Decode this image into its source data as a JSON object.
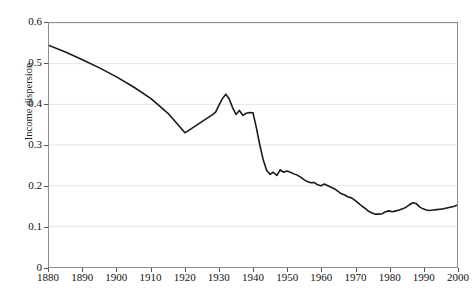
{
  "chart_data": {
    "type": "line",
    "title": "",
    "xlabel": "",
    "ylabel": "Income dispersion",
    "xlim": [
      1880,
      2000
    ],
    "ylim": [
      0,
      0.6
    ],
    "grid": true,
    "legend": null,
    "xticks": [
      1880,
      1890,
      1900,
      1910,
      1920,
      1930,
      1940,
      1950,
      1960,
      1970,
      1980,
      1990,
      2000
    ],
    "xtick_labels": [
      "1880",
      "1890",
      "1900",
      "1910",
      "1920",
      "1930",
      "1940",
      "1950",
      "1960",
      "1970",
      "1980",
      "1990",
      "2000"
    ],
    "yticks": [
      0,
      0.1,
      0.2,
      0.3,
      0.4,
      0.5,
      0.6
    ],
    "ytick_labels": [
      "0",
      "0.1",
      "0.2",
      "0.3",
      "0.4",
      "0.5",
      "0.6"
    ],
    "line_color": "#1a1a1a",
    "line_width": 1.6,
    "grid_color": "#e2e2e2",
    "frame_color": "#8c8c8c",
    "background_color": "#ffffff",
    "series": [
      {
        "name": "Income dispersion",
        "x": [
          1880,
          1885,
          1890,
          1895,
          1900,
          1905,
          1910,
          1915,
          1920,
          1922,
          1924,
          1926,
          1928,
          1929,
          1930,
          1931,
          1932,
          1933,
          1934,
          1935,
          1936,
          1937,
          1938,
          1939,
          1940,
          1941,
          1942,
          1943,
          1944,
          1945,
          1946,
          1947,
          1948,
          1949,
          1950,
          1951,
          1952,
          1953,
          1954,
          1955,
          1956,
          1957,
          1958,
          1959,
          1960,
          1961,
          1962,
          1963,
          1964,
          1965,
          1966,
          1967,
          1968,
          1969,
          1970,
          1971,
          1972,
          1973,
          1974,
          1975,
          1976,
          1977,
          1978,
          1979,
          1980,
          1981,
          1982,
          1983,
          1984,
          1985,
          1986,
          1987,
          1988,
          1989,
          1990,
          1991,
          1992,
          1993,
          1994,
          1995,
          1996,
          1997,
          1998,
          1999,
          2000
        ],
        "y": [
          0.545,
          0.528,
          0.509,
          0.489,
          0.467,
          0.442,
          0.414,
          0.378,
          0.33,
          0.341,
          0.352,
          0.363,
          0.374,
          0.381,
          0.398,
          0.414,
          0.425,
          0.413,
          0.392,
          0.375,
          0.385,
          0.373,
          0.378,
          0.38,
          0.379,
          0.342,
          0.3,
          0.264,
          0.238,
          0.228,
          0.233,
          0.225,
          0.239,
          0.233,
          0.236,
          0.233,
          0.229,
          0.226,
          0.221,
          0.215,
          0.21,
          0.207,
          0.208,
          0.202,
          0.2,
          0.204,
          0.2,
          0.196,
          0.192,
          0.186,
          0.18,
          0.177,
          0.172,
          0.17,
          0.164,
          0.157,
          0.15,
          0.144,
          0.137,
          0.133,
          0.13,
          0.13,
          0.131,
          0.136,
          0.138,
          0.136,
          0.138,
          0.14,
          0.143,
          0.147,
          0.153,
          0.158,
          0.156,
          0.148,
          0.143,
          0.14,
          0.139,
          0.14,
          0.141,
          0.142,
          0.143,
          0.145,
          0.147,
          0.149,
          0.152
        ]
      }
    ]
  }
}
